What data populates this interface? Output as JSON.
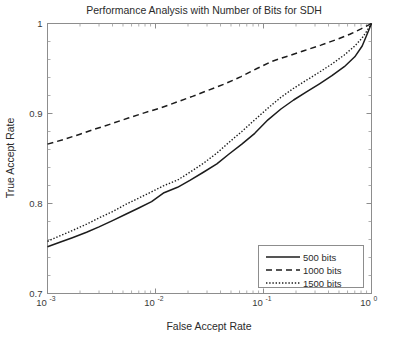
{
  "chart_data": {
    "type": "line",
    "title": "Performance Analysis with Number of Bits for SDH",
    "xlabel": "False Accept Rate",
    "ylabel": "True Accept Rate",
    "xscale": "log",
    "yscale": "linear",
    "xlim": [
      0.001,
      1
    ],
    "ylim": [
      0.7,
      1
    ],
    "grid": false,
    "legend_position": "lower right",
    "xticks": [
      0.001,
      0.01,
      0.1,
      1
    ],
    "xtick_labels": [
      "10-3",
      "10-2",
      "10-1",
      "100"
    ],
    "xtick_bases": [
      "10",
      "10",
      "10",
      "10"
    ],
    "xtick_exponents": [
      "-3",
      "-2",
      "-1",
      "0"
    ],
    "yticks": [
      0.7,
      0.8,
      0.9,
      1
    ],
    "ytick_labels": [
      "0.7",
      "0.8",
      "0.9",
      "1"
    ],
    "series": [
      {
        "name": "500 bits",
        "style": "solid",
        "color": "#1c1c1c",
        "x": [
          0.001,
          0.0013,
          0.0017,
          0.0023,
          0.003,
          0.004,
          0.0053,
          0.007,
          0.0092,
          0.012,
          0.016,
          0.021,
          0.028,
          0.037,
          0.048,
          0.063,
          0.083,
          0.11,
          0.145,
          0.19,
          0.25,
          0.33,
          0.43,
          0.56,
          0.7,
          0.82,
          0.91,
          1.0
        ],
        "y": [
          0.752,
          0.757,
          0.762,
          0.768,
          0.774,
          0.781,
          0.788,
          0.795,
          0.802,
          0.812,
          0.818,
          0.826,
          0.835,
          0.844,
          0.855,
          0.866,
          0.878,
          0.893,
          0.905,
          0.915,
          0.924,
          0.933,
          0.942,
          0.952,
          0.963,
          0.975,
          0.988,
          1.0
        ]
      },
      {
        "name": "1000 bits",
        "style": "dashed",
        "color": "#1c1c1c",
        "x": [
          0.001,
          0.0014,
          0.002,
          0.0028,
          0.004,
          0.0056,
          0.008,
          0.011,
          0.016,
          0.022,
          0.031,
          0.044,
          0.062,
          0.087,
          0.12,
          0.17,
          0.24,
          0.34,
          0.47,
          0.63,
          0.8,
          1.0
        ],
        "y": [
          0.866,
          0.871,
          0.877,
          0.883,
          0.889,
          0.895,
          0.901,
          0.906,
          0.913,
          0.919,
          0.926,
          0.933,
          0.941,
          0.95,
          0.958,
          0.964,
          0.97,
          0.976,
          0.982,
          0.988,
          0.994,
          1.0
        ]
      },
      {
        "name": "1500 bits",
        "style": "dotted",
        "color": "#1c1c1c",
        "x": [
          0.001,
          0.0013,
          0.0017,
          0.0023,
          0.003,
          0.004,
          0.0053,
          0.007,
          0.0092,
          0.012,
          0.016,
          0.021,
          0.028,
          0.037,
          0.048,
          0.063,
          0.083,
          0.11,
          0.145,
          0.19,
          0.25,
          0.33,
          0.43,
          0.56,
          0.7,
          0.82,
          0.91,
          1.0
        ],
        "y": [
          0.758,
          0.764,
          0.77,
          0.777,
          0.784,
          0.791,
          0.799,
          0.806,
          0.813,
          0.82,
          0.826,
          0.835,
          0.845,
          0.856,
          0.868,
          0.88,
          0.893,
          0.906,
          0.918,
          0.928,
          0.937,
          0.946,
          0.955,
          0.965,
          0.975,
          0.984,
          0.992,
          1.0
        ]
      }
    ]
  },
  "legend": {
    "items": [
      {
        "label": "500 bits"
      },
      {
        "label": "1000 bits"
      },
      {
        "label": "1500 bits"
      }
    ]
  }
}
